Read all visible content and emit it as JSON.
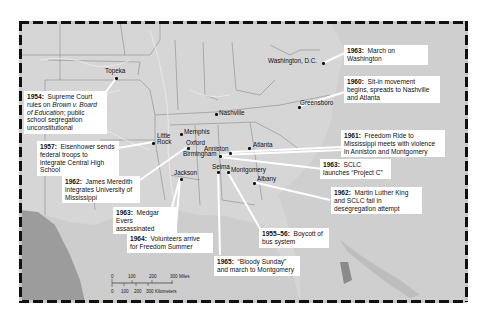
{
  "map": {
    "title": "Civil Rights Movement events in the American South",
    "colors": {
      "land": "#d6d6d6",
      "ocean_gulf": "#cdcdcd",
      "mexico": "#9a9a9a",
      "state_border": "#8a8a8a",
      "river": "#ededed",
      "callout_bg": "#ffffff",
      "leader_line": "#ffffff",
      "frame_dark": "#111111"
    },
    "cities": [
      {
        "name": "Topeka",
        "x": 116,
        "y": 78
      },
      {
        "name": "Washington, D.C.",
        "x": 323,
        "y": 63
      },
      {
        "name": "Nashville",
        "x": 216,
        "y": 114
      },
      {
        "name": "Greensboro",
        "x": 300,
        "y": 106
      },
      {
        "name": "Memphis",
        "x": 181,
        "y": 134
      },
      {
        "name": "Little Rock",
        "x": 153,
        "y": 142
      },
      {
        "name": "Oxford",
        "x": 187,
        "y": 147
      },
      {
        "name": "Anniston",
        "x": 229,
        "y": 152
      },
      {
        "name": "Birmingham",
        "x": 220,
        "y": 155
      },
      {
        "name": "Atlanta",
        "x": 249,
        "y": 146
      },
      {
        "name": "Jackson",
        "x": 180,
        "y": 178
      },
      {
        "name": "Selma",
        "x": 218,
        "y": 171
      },
      {
        "name": "Montgomery",
        "x": 227,
        "y": 171
      },
      {
        "name": "Albany",
        "x": 253,
        "y": 182
      }
    ],
    "events": [
      {
        "year": "1963:",
        "text": "March on Washington",
        "id": "march-washington"
      },
      {
        "year": "1960:",
        "text": "Sit-in movement begins, spreads to Nashville and Atlanta",
        "id": "sit-in"
      },
      {
        "year": "1954:",
        "text_parts": [
          "Supreme Court rules on ",
          "Brown v. Board of Education",
          "; public school segregation unconstitutional"
        ],
        "id": "brown"
      },
      {
        "year": "1961:",
        "text": "Freedom Ride to Mississippi meets with violence in Anniston and Montgomery",
        "id": "freedom-ride"
      },
      {
        "year": "1957:",
        "text": "Eisenhower sends federal troops to integrate Central High School",
        "id": "little-rock"
      },
      {
        "year": "1963:",
        "text": "SCLC launches “Project C”",
        "id": "project-c"
      },
      {
        "year": "1962:",
        "text": "James Meredith integrates University of Mississippi",
        "id": "meredith"
      },
      {
        "year": "1962:",
        "text": "Martin Luther King and SCLC fail in desegregation attempt",
        "id": "albany"
      },
      {
        "year": "1963:",
        "text": "Medgar Evers assassinated",
        "id": "evers"
      },
      {
        "year": "1955–56:",
        "text": "Boycott of bus system",
        "id": "bus-boycott"
      },
      {
        "year": "1964:",
        "text": "Volunteers arrive for Freedom Summer",
        "id": "freedom-summer"
      },
      {
        "year": "1965:",
        "text": "“Bloody Sunday” and march to Montgomery",
        "id": "bloody-sunday"
      }
    ],
    "scale_bar": {
      "miles_ticks": [
        "0",
        "100",
        "200",
        "300 Miles"
      ],
      "km_ticks": [
        "0",
        "100",
        "200",
        "300 Kilometers"
      ]
    }
  }
}
